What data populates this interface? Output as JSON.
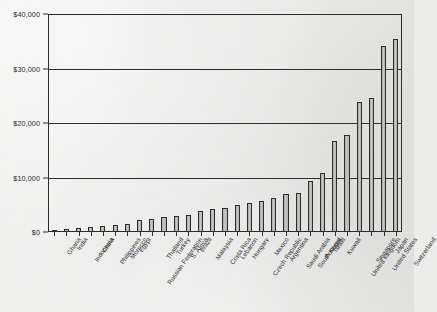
{
  "chart_data": {
    "type": "bar",
    "title": "",
    "xlabel": "",
    "ylabel": "",
    "ylim": [
      0,
      40000
    ],
    "grid": true,
    "legend": "none",
    "orientation": "vertical",
    "ytick_labels": [
      "$0",
      "$10,000",
      "$20,000",
      "$30,000",
      "$40,000"
    ],
    "ytick_values": [
      0,
      10000,
      20000,
      30000,
      40000
    ],
    "categories": [
      "Ghana",
      "India",
      "Indonesia",
      "China",
      "Philippines",
      "Morocco",
      "Egypt",
      "Russian Federation",
      "Thailand",
      "Turkey",
      "S. Africa",
      "Brazil",
      "Malaysia",
      "Costa Rica",
      "Lebanon",
      "Hungary",
      "Czech Republic",
      "Mexico",
      "Argentina",
      "Saudi Arabia",
      "South Korea",
      "Portugal",
      "Israel",
      "Kuwait",
      "United Kingdom",
      "Singapore",
      "United States",
      "Japan",
      "Switzerland"
    ],
    "values": [
      300,
      500,
      700,
      1000,
      1100,
      1200,
      1500,
      2200,
      2300,
      2700,
      3000,
      3200,
      3900,
      4300,
      4400,
      5000,
      5400,
      5600,
      6200,
      7000,
      7200,
      9400,
      10800,
      16700,
      17800,
      23800,
      24500,
      34200,
      35500
    ]
  }
}
